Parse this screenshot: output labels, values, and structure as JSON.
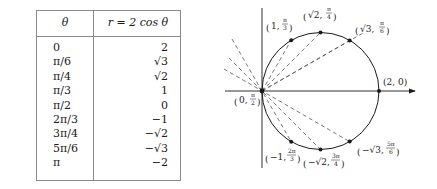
{
  "table": {
    "headers": {
      "theta": "θ",
      "r": "r = 2 cos θ"
    },
    "rows": [
      {
        "theta": "0",
        "r": "2"
      },
      {
        "theta": "π/6",
        "r": "√3"
      },
      {
        "theta": "π/4",
        "r": "√2"
      },
      {
        "theta": "π/3",
        "r": "1"
      },
      {
        "theta": "π/2",
        "r": "0"
      },
      {
        "theta": "2π/3",
        "r": "−1"
      },
      {
        "theta": "3π/4",
        "r": "−√2"
      },
      {
        "theta": "5π/6",
        "r": "−√3"
      },
      {
        "theta": "π",
        "r": "−2"
      }
    ]
  },
  "graph": {
    "curve": "r = 2 cos θ (circle, center (1,0), radius 1)",
    "points": [
      {
        "label_r": "2",
        "label_theta": "0",
        "text": "(2, 0)"
      },
      {
        "label_r": "√3",
        "label_theta": "π/6",
        "text": "(√3, π/6)"
      },
      {
        "label_r": "√2",
        "label_theta": "π/4",
        "text": "(√2, π/4)"
      },
      {
        "label_r": "1",
        "label_theta": "π/3",
        "text": "(1, π/3)"
      },
      {
        "label_r": "0",
        "label_theta": "π/2",
        "text": "(0, π/2)"
      },
      {
        "label_r": "−1",
        "label_theta": "2π/3",
        "text": "(−1, 2π/3)"
      },
      {
        "label_r": "−√2",
        "label_theta": "3π/4",
        "text": "(−√2, 3π/4)"
      },
      {
        "label_r": "−√3",
        "label_theta": "5π/6",
        "text": "(−√3, 5π/6)"
      }
    ],
    "colors": {
      "ink": "#1a1a1a",
      "rule": "#8a8a8a",
      "dash": "#555555"
    }
  }
}
